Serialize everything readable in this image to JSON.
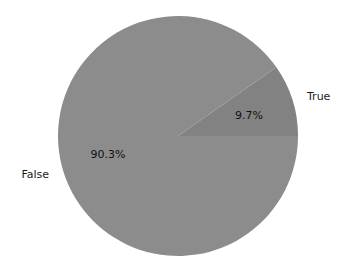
{
  "chart_data": {
    "type": "pie",
    "title": "",
    "categories": [
      "False",
      "True"
    ],
    "values": [
      90.3,
      9.7
    ],
    "labels": [
      "False",
      "True"
    ],
    "autopct": [
      "90.3%",
      "9.7%"
    ],
    "colors": [
      "#8c8c8c",
      "#828282"
    ],
    "startangle_deg": 0,
    "direction": "counterclockwise",
    "legend": false
  },
  "slices": [
    {
      "label": "False",
      "pct_text": "90.3%",
      "value": 90.3,
      "color": "#8c8c8c"
    },
    {
      "label": "True",
      "pct_text": "9.7%",
      "value": 9.7,
      "color": "#828282"
    }
  ]
}
